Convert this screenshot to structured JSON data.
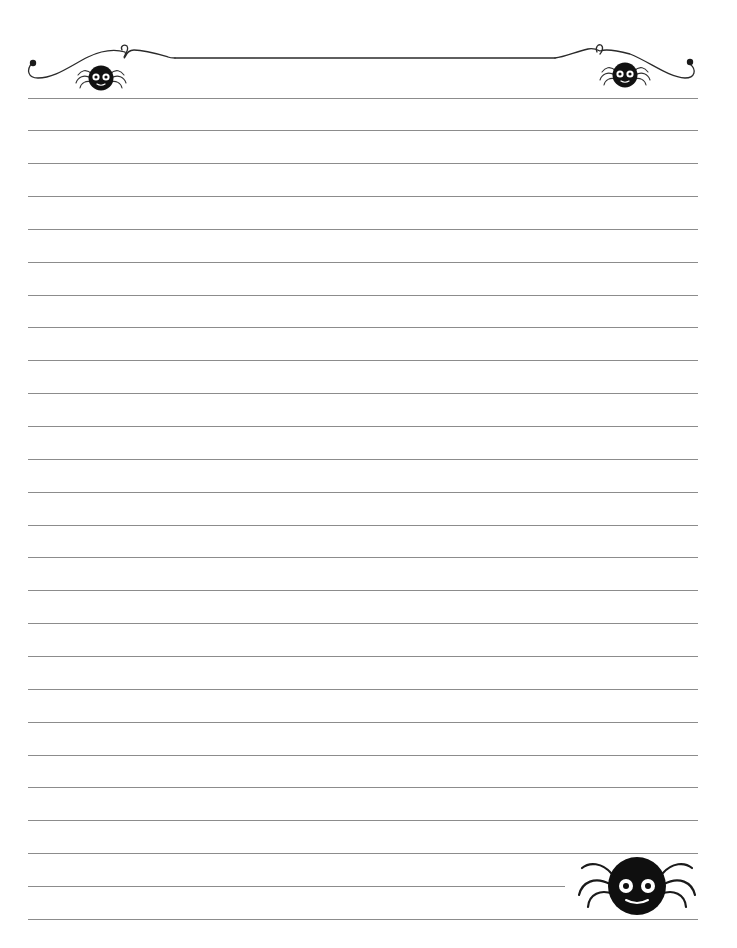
{
  "page": {
    "type": "lined-writing-paper",
    "theme": "halloween-spiders",
    "background_color": "#ffffff",
    "line_color": "#8c8c8c",
    "ink_color": "#1a1a1a"
  },
  "header": {
    "ornament": "scroll-flourish-border",
    "decorations": [
      "spider-icon-left",
      "spider-icon-right"
    ]
  },
  "lines": {
    "count": 26,
    "first_y": 97.5,
    "spacing": 32.85,
    "left_x": 28,
    "right_x": 698,
    "short_line_index": 24,
    "short_line_right_x": 565
  },
  "footer": {
    "decoration": "large-spider-icon"
  }
}
